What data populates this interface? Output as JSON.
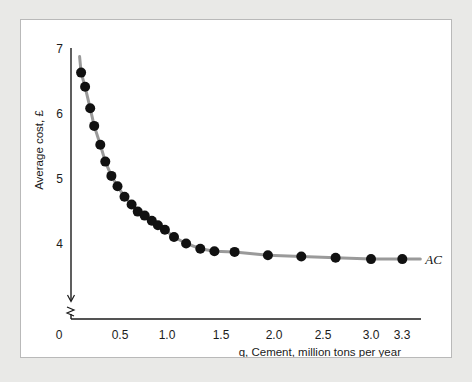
{
  "figure": {
    "background_color": "#e9e9e7",
    "panel_color": "#ffffff",
    "panel_border_color": "#b9b9b9"
  },
  "chart_data": {
    "type": "scatter",
    "title": "",
    "subtitle": "",
    "xlabel": "q, Cement, million tons per year",
    "ylabel": "Average cost, £",
    "xlim": [
      0,
      3.3
    ],
    "ylim": [
      3.5,
      7.15
    ],
    "grid": false,
    "legend_position": "right-of-curve-end",
    "axis_break_y": true,
    "x_ticks": [
      "0",
      "0.5",
      "1.0",
      "1.5",
      "2.0",
      "2.5",
      "3.0",
      "3.3"
    ],
    "x_tick_values": [
      0,
      0.5,
      1.0,
      1.5,
      2.0,
      2.5,
      3.0,
      3.3
    ],
    "y_ticks": [
      "4",
      "5",
      "6",
      "7"
    ],
    "y_tick_values": [
      4,
      5,
      6,
      7
    ],
    "series": [
      {
        "name": "AC",
        "label": "AC",
        "line_color": "#9a9a9a",
        "marker_color": "#111111",
        "marker_size": 5,
        "x": [
          0.1,
          0.14,
          0.19,
          0.23,
          0.29,
          0.34,
          0.4,
          0.46,
          0.53,
          0.6,
          0.66,
          0.73,
          0.8,
          0.86,
          0.93,
          1.02,
          1.14,
          1.28,
          1.42,
          1.62,
          1.95,
          2.28,
          2.62,
          2.97,
          3.28
        ],
        "y": [
          6.63,
          6.41,
          6.08,
          5.81,
          5.52,
          5.26,
          5.04,
          4.88,
          4.72,
          4.6,
          4.49,
          4.43,
          4.35,
          4.28,
          4.21,
          4.1,
          4.0,
          3.92,
          3.88,
          3.87,
          3.82,
          3.8,
          3.78,
          3.76,
          3.76
        ]
      }
    ]
  }
}
